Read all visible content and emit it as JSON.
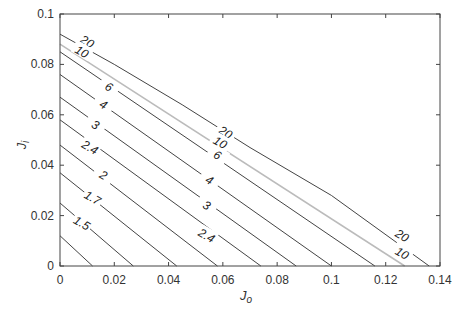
{
  "chart_data": {
    "type": "contour",
    "title": "",
    "xlabel": "J_o",
    "ylabel": "J_i",
    "xlim": [
      0,
      0.14
    ],
    "ylim": [
      0,
      0.1
    ],
    "xticks": [
      "0",
      "0.02",
      "0.04",
      "0.06",
      "0.08",
      "0.1",
      "0.12",
      "0.14"
    ],
    "yticks": [
      "0",
      "0.02",
      "0.04",
      "0.06",
      "0.08",
      "0.1"
    ],
    "grid": false,
    "legend": null,
    "contours": [
      {
        "level": "1.5",
        "color": "#444444",
        "points": [
          [
            0,
            0.012
          ],
          [
            0.012,
            0
          ]
        ],
        "label_at": null
      },
      {
        "level": "1.5",
        "color": "#444444",
        "points": [
          [
            0,
            0.025
          ],
          [
            0.027,
            0
          ]
        ],
        "label_at": [
          0.008,
          0.017
        ]
      },
      {
        "level": "1.7",
        "color": "#444444",
        "points": [
          [
            0,
            0.037
          ],
          [
            0.043,
            0
          ]
        ],
        "label_at": [
          0.012,
          0.027
        ]
      },
      {
        "level": "2",
        "color": "#444444",
        "points": [
          [
            0,
            0.048
          ],
          [
            0.058,
            0
          ]
        ],
        "label_at": [
          0.016,
          0.036
        ]
      },
      {
        "level": "2.4",
        "color": "#444444",
        "points": [
          [
            0,
            0.058
          ],
          [
            0.074,
            0
          ]
        ],
        "label_at": [
          0.054,
          0.012
        ]
      },
      {
        "level": "3",
        "color": "#444444",
        "points": [
          [
            0,
            0.067
          ],
          [
            0.087,
            0
          ]
        ],
        "label_at": [
          0.054,
          0.024
        ]
      },
      {
        "level": "4",
        "color": "#444444",
        "points": [
          [
            0,
            0.076
          ],
          [
            0.1,
            0
          ]
        ],
        "label_at": [
          0.055,
          0.034
        ]
      },
      {
        "level": "6",
        "color": "#444444",
        "points": [
          [
            0,
            0.085
          ],
          [
            0.116,
            0
          ]
        ],
        "label_at": [
          0.058,
          0.044
        ]
      },
      {
        "level": "10",
        "color": "#bbbbbb",
        "points": [
          [
            0,
            0.088
          ],
          [
            0.127,
            0
          ]
        ],
        "label_at": [
          0.126,
          0.005
        ]
      },
      {
        "level": "20",
        "color": "#444444",
        "points": [
          [
            0,
            0.092
          ],
          [
            0.02,
            0.08
          ],
          [
            0.045,
            0.064
          ],
          [
            0.07,
            0.047
          ],
          [
            0.1,
            0.028
          ],
          [
            0.136,
            0
          ]
        ],
        "label_at": [
          0.126,
          0.012
        ]
      }
    ],
    "extra_labels": [
      {
        "text": "20",
        "x": 0.01,
        "y": 0.089
      },
      {
        "text": "10",
        "x": 0.008,
        "y": 0.085
      },
      {
        "text": "6",
        "x": 0.018,
        "y": 0.071
      },
      {
        "text": "4",
        "x": 0.016,
        "y": 0.064
      },
      {
        "text": "3",
        "x": 0.013,
        "y": 0.056
      },
      {
        "text": "2.4",
        "x": 0.011,
        "y": 0.047
      },
      {
        "text": "20",
        "x": 0.061,
        "y": 0.053
      },
      {
        "text": "10",
        "x": 0.059,
        "y": 0.049
      }
    ]
  }
}
